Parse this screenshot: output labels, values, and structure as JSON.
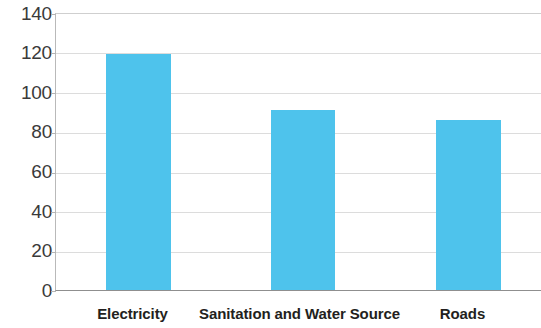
{
  "chart_data": {
    "type": "bar",
    "title": "",
    "subtitle": "",
    "xlabel": "",
    "ylabel": "",
    "categories": [
      "Electricity",
      "Sanitation and Water Source",
      "Roads"
    ],
    "values": [
      119.5,
      91.5,
      86
    ],
    "series": [
      {
        "name": "",
        "values": [
          119.5,
          91.5,
          86
        ]
      }
    ],
    "ylim": [
      0,
      140
    ],
    "ytick_labels": [
      "140",
      "120",
      "100",
      "80",
      "60",
      "40",
      "20",
      "0"
    ],
    "ytick_values": [
      140,
      120,
      100,
      80,
      60,
      40,
      20,
      0
    ],
    "grid": true,
    "legend": false,
    "legend_position": "none",
    "bar_color": "#4ec3ec",
    "gridline_color": "#dcdcdc",
    "axis_color": "#8f8f8f",
    "text_color": "#231f20"
  }
}
